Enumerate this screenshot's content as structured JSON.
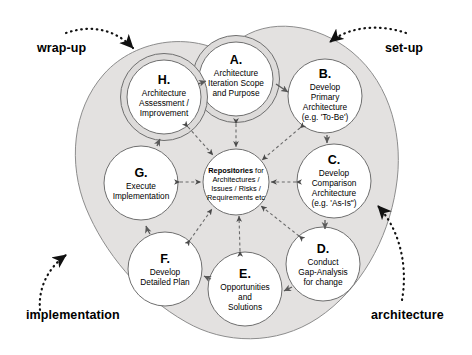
{
  "diagram": {
    "colors": {
      "shell_fill": "#e3e1e0",
      "shell_stroke": "#8d8d8d",
      "circle_fill": "#ffffff",
      "circle_stroke": "#6f6f6f",
      "ring_fill": "#dddbda",
      "arrow": "#4a4a4a",
      "text": "#000000",
      "background": "#ffffff"
    },
    "external_labels": [
      {
        "id": "wrap-up",
        "text": "wrap-up",
        "points_to": "H"
      },
      {
        "id": "set-up",
        "text": "set-up",
        "points_to": "A"
      },
      {
        "id": "implementation",
        "text": "implementation",
        "points_to": "F"
      },
      {
        "id": "architecture",
        "text": "architecture",
        "points_to": "C"
      }
    ],
    "hub": {
      "id": "repositories",
      "lines": [
        {
          "text": "Repositories",
          "bold": true,
          "suffix": " for"
        },
        {
          "text": "Architectures /",
          "bold": false
        },
        {
          "text": "Issues / Risks /",
          "bold": false
        },
        {
          "text": "Requirements etc",
          "bold": false
        }
      ],
      "full_text": "Repositories for Architectures / Issues / Risks / Requirements etc"
    },
    "nodes": [
      {
        "id": "A",
        "letter": "A.",
        "lines": [
          "Architecture",
          "Iteration Scope",
          "and Purpose"
        ],
        "cx": 236,
        "cy": 79,
        "r": 36,
        "ring": true
      },
      {
        "id": "B",
        "letter": "B.",
        "lines": [
          "Develop",
          "Primary",
          "Architecture",
          "(e.g. 'To-Be')"
        ],
        "cx": 325,
        "cy": 96,
        "r": 37,
        "ring": false
      },
      {
        "id": "C",
        "letter": "C.",
        "lines": [
          "Develop",
          "Comparison",
          "Architecture",
          "(e.g. 'As-Is\")"
        ],
        "cx": 334,
        "cy": 181,
        "r": 37,
        "ring": false
      },
      {
        "id": "D",
        "letter": "D.",
        "lines": [
          "Conduct",
          "Gap-Analysis",
          "for change"
        ],
        "cx": 323,
        "cy": 264,
        "r": 37,
        "ring": false
      },
      {
        "id": "E",
        "letter": "E.",
        "lines": [
          "Opportunities",
          "and",
          "Solutions"
        ],
        "cx": 245,
        "cy": 289,
        "r": 37,
        "ring": false
      },
      {
        "id": "F",
        "letter": "F.",
        "lines": [
          "Develop",
          "Detailed Plan"
        ],
        "cx": 165,
        "cy": 269,
        "r": 37,
        "ring": false
      },
      {
        "id": "G",
        "letter": "G.",
        "lines": [
          "Execute",
          "Implementation"
        ],
        "cx": 141,
        "cy": 183,
        "r": 37,
        "ring": false
      },
      {
        "id": "H",
        "letter": "H.",
        "lines": [
          "Architecture",
          "Assessment /",
          "Improvement"
        ],
        "cx": 164,
        "cy": 97,
        "r": 36,
        "ring": true
      }
    ],
    "cycle_sequence": [
      "A",
      "B",
      "C",
      "D",
      "E",
      "F",
      "G",
      "H",
      "A"
    ],
    "hub_links": [
      "A",
      "B",
      "C",
      "D",
      "E",
      "F",
      "G",
      "H"
    ]
  }
}
